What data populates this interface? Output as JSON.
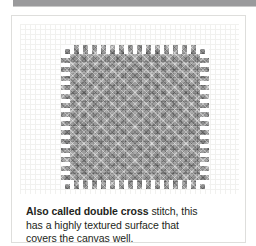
{
  "page": {
    "background_color": "#ffffff",
    "top_bar": {
      "name": "header-rule",
      "color": "#9a9a9c"
    }
  },
  "card": {
    "border_color": "#dededc",
    "background_color": "#ffffff"
  },
  "illustration": {
    "subject": "double cross stitch swatch",
    "swatch_color": "#8e8e8e",
    "canvas_grid_color": "#f1f1ef",
    "alt": "Square swatch of dense gray double cross stitches worked over canvas mesh"
  },
  "caption": {
    "lead": "Also called double cross",
    "line1_rest": " stitch, this",
    "line2": "has a highly textured surface that",
    "line3": "covers the canvas well.",
    "full_text": "Also called double cross stitch, this has a highly textured surface that covers the canvas well.",
    "text_color": "#231f20"
  }
}
